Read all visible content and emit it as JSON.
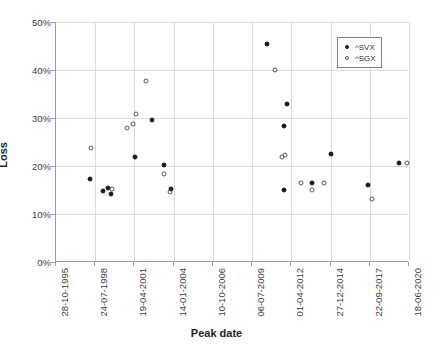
{
  "chart_data": {
    "type": "scatter",
    "title": "",
    "xlabel": "Peak date",
    "ylabel": "Loss",
    "xlim": [
      "28-10-1995",
      "18-06-2020"
    ],
    "ylim": [
      0,
      50
    ],
    "grid": true,
    "legend_position": "top-right",
    "y_ticks": [
      "0%",
      "10%",
      "20%",
      "30%",
      "40%",
      "50%"
    ],
    "y_tick_values": [
      0,
      10,
      20,
      30,
      40,
      50
    ],
    "x_ticks": [
      "28-10-1995",
      "24-07-1998",
      "19-04-2001",
      "14-01-2004",
      "10-10-2006",
      "06-07-2009",
      "01-04-2012",
      "27-12-2014",
      "22-09-2017",
      "18-06-2020"
    ],
    "series": [
      {
        "name": "^SVX",
        "marker": "filled-circle",
        "color": "#1a1a1a",
        "points": [
          {
            "x": 9.7,
            "y": 17.3
          },
          {
            "x": 13.2,
            "y": 14.7
          },
          {
            "x": 14.7,
            "y": 15.5
          },
          {
            "x": 15.5,
            "y": 14.2
          },
          {
            "x": 22.5,
            "y": 21.9
          },
          {
            "x": 27.2,
            "y": 29.6
          },
          {
            "x": 30.7,
            "y": 20.2
          },
          {
            "x": 32.6,
            "y": 15.3
          },
          {
            "x": 59.7,
            "y": 45.5
          },
          {
            "x": 65.5,
            "y": 32.9
          },
          {
            "x": 64.6,
            "y": 28.4
          },
          {
            "x": 64.7,
            "y": 15.0
          },
          {
            "x": 72.6,
            "y": 16.4
          },
          {
            "x": 77.9,
            "y": 22.6
          },
          {
            "x": 88.4,
            "y": 16.1
          },
          {
            "x": 97.2,
            "y": 20.7
          }
        ]
      },
      {
        "name": "^SGX",
        "marker": "open-circle",
        "color": "#555555",
        "points": [
          {
            "x": 9.9,
            "y": 23.8
          },
          {
            "x": 16.0,
            "y": 15.3
          },
          {
            "x": 20.0,
            "y": 28.0
          },
          {
            "x": 21.9,
            "y": 28.8
          },
          {
            "x": 22.8,
            "y": 30.8
          },
          {
            "x": 25.5,
            "y": 37.8
          },
          {
            "x": 30.7,
            "y": 18.4
          },
          {
            "x": 32.2,
            "y": 14.5
          },
          {
            "x": 62.1,
            "y": 39.9
          },
          {
            "x": 64.0,
            "y": 21.8
          },
          {
            "x": 64.9,
            "y": 22.2
          },
          {
            "x": 69.3,
            "y": 16.4
          },
          {
            "x": 72.5,
            "y": 15.1
          },
          {
            "x": 75.9,
            "y": 16.5
          },
          {
            "x": 89.6,
            "y": 13.1
          },
          {
            "x": 99.5,
            "y": 20.6
          }
        ]
      }
    ]
  },
  "legend": {
    "entries": [
      {
        "label": "^SVX"
      },
      {
        "label": "^SGX"
      }
    ]
  },
  "caption": {
    "text": ""
  }
}
